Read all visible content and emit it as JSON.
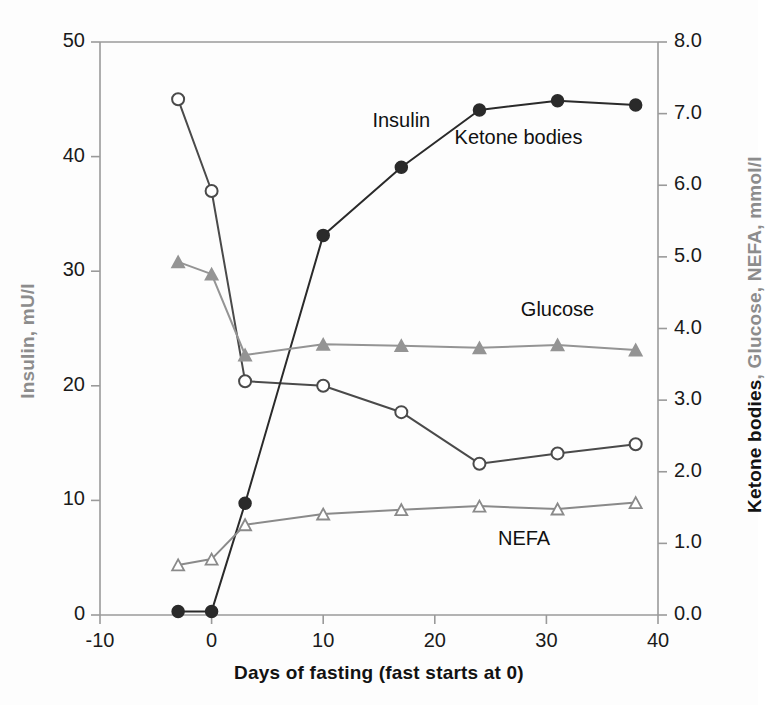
{
  "chart_data": {
    "type": "line",
    "title": "",
    "xlabel": "Days of fasting (fast starts at 0)",
    "ylabel_left": "Insulin, mU/l",
    "ylabel_right_bold": "Ketone bodies",
    "ylabel_right_gray": ", Glucose, NEFA, mmol/l",
    "xlim": [
      -10,
      40
    ],
    "ylim_left": [
      0,
      50
    ],
    "ylim_right": [
      0.0,
      8.0
    ],
    "xticks": [
      "-10",
      "0",
      "10",
      "20",
      "30",
      "40"
    ],
    "xtick_values": [
      -10,
      0,
      10,
      20,
      30,
      40
    ],
    "yticks_left": [
      "0",
      "10",
      "20",
      "30",
      "40",
      "50"
    ],
    "ytick_left_values": [
      0,
      10,
      20,
      30,
      40,
      50
    ],
    "yticks_right": [
      "0.0",
      "1.0",
      "2.0",
      "3.0",
      "4.0",
      "5.0",
      "6.0",
      "7.0",
      "8.0"
    ],
    "ytick_right_values": [
      0.0,
      1.0,
      2.0,
      3.0,
      4.0,
      5.0,
      6.0,
      7.0,
      8.0
    ],
    "grid": false,
    "legend_position": "inline-annotations",
    "series": [
      {
        "name": "Insulin",
        "axis": "left",
        "unit": "mU/l",
        "color": "#4a4a4a",
        "marker": "open-circle",
        "x": [
          -3,
          0,
          3,
          10,
          17,
          24,
          31,
          38
        ],
        "values": [
          45.0,
          37.0,
          20.4,
          20.0,
          17.7,
          13.2,
          14.1,
          14.9
        ],
        "label_x": 17,
        "label_y": 43.0
      },
      {
        "name": "Ketone bodies",
        "axis": "right",
        "unit": "mmol/l",
        "color": "#2a2a2a",
        "marker": "filled-circle",
        "x": [
          -3,
          0,
          3,
          10,
          17,
          24,
          31,
          38
        ],
        "values": [
          0.05,
          0.05,
          1.56,
          5.3,
          6.25,
          7.05,
          7.18,
          7.12
        ],
        "label_x": 27.5,
        "label_y": 6.65
      },
      {
        "name": "Glucose",
        "axis": "right",
        "unit": "mmol/l",
        "color": "#949494",
        "marker": "filled-triangle",
        "x": [
          -3,
          0,
          3,
          10,
          17,
          24,
          31,
          38
        ],
        "values": [
          4.93,
          4.76,
          3.63,
          3.78,
          3.76,
          3.73,
          3.77,
          3.7
        ],
        "label_x": 31.0,
        "label_y": 4.25
      },
      {
        "name": "NEFA",
        "axis": "right",
        "unit": "mmol/l",
        "color": "#8a8a8a",
        "marker": "open-triangle",
        "x": [
          -3,
          0,
          3,
          10,
          17,
          24,
          31,
          38
        ],
        "values": [
          0.7,
          0.78,
          1.26,
          1.41,
          1.47,
          1.52,
          1.48,
          1.57
        ],
        "label_x": 28.0,
        "label_y": 1.05
      }
    ]
  },
  "axis": {
    "frame_color": "#9a9a9a"
  }
}
